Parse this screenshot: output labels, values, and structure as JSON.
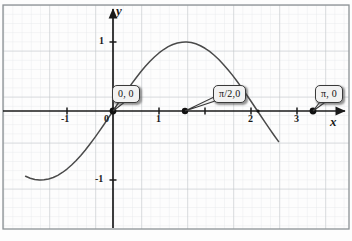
{
  "figure": {
    "kind": "cartesian-graph",
    "background_color": "#fdfdfd",
    "grid_minor_color": "#dfe3e6",
    "grid_major_color": "#b9bec2",
    "axis_color": "#1a1a1a",
    "curve_color": "#4a4a4a",
    "border_color": "#8d9296"
  },
  "axes": {
    "x_axis_label": "x",
    "y_axis_label": "y",
    "x_ticks": [
      {
        "value": -1,
        "label": "-1"
      },
      {
        "value": 0,
        "label": "0"
      },
      {
        "value": 1,
        "label": "1"
      },
      {
        "value": 2,
        "label": "2"
      },
      {
        "value": 3,
        "label": "3"
      }
    ],
    "y_ticks": [
      {
        "value": 1,
        "label": "1"
      },
      {
        "value": -1,
        "label": "-1"
      }
    ]
  },
  "callouts": [
    {
      "id": "origin",
      "label": "0, 0",
      "x": 0,
      "y": 0
    },
    {
      "id": "half-pi",
      "label": "π/2,0",
      "x": 1.5708,
      "y": 0
    },
    {
      "id": "pi",
      "label": "π, 0",
      "x": 3.1416,
      "y": 0
    }
  ],
  "chart_data": {
    "type": "line",
    "title": "",
    "xlabel": "x",
    "ylabel": "y",
    "xlim": [
      -1.9,
      3.6
    ],
    "ylim": [
      -1.62,
      1.55
    ],
    "grid": true,
    "legend": false,
    "series": [
      {
        "name": "sin(x)",
        "expression": "y = sin(x)",
        "x": [
          -1.9,
          -1.8,
          -1.7,
          -1.6,
          -1.5708,
          -1.5,
          -1.4,
          -1.3,
          -1.2,
          -1.1,
          -1.0,
          -0.9,
          -0.8,
          -0.7,
          -0.6,
          -0.5,
          -0.4,
          -0.3,
          -0.2,
          -0.1,
          0.0,
          0.1,
          0.2,
          0.3,
          0.4,
          0.5,
          0.6,
          0.7,
          0.8,
          0.9,
          1.0,
          1.1,
          1.2,
          1.3,
          1.4,
          1.5,
          1.5708,
          1.6,
          1.7,
          1.8,
          1.9,
          2.0,
          2.1,
          2.2,
          2.3,
          2.4,
          2.5,
          2.6,
          2.7,
          2.8,
          2.9,
          3.0,
          3.1416,
          3.2,
          3.3,
          3.4,
          3.5,
          3.6
        ],
        "y": [
          -0.946,
          -0.974,
          -0.992,
          -1.0,
          -1.0,
          -0.997,
          -0.985,
          -0.964,
          -0.932,
          -0.891,
          -0.841,
          -0.783,
          -0.717,
          -0.644,
          -0.565,
          -0.479,
          -0.389,
          -0.296,
          -0.199,
          -0.1,
          0.0,
          0.1,
          0.199,
          0.296,
          0.389,
          0.479,
          0.565,
          0.644,
          0.717,
          0.783,
          0.841,
          0.891,
          0.932,
          0.964,
          0.985,
          0.997,
          1.0,
          1.0,
          0.992,
          0.974,
          0.946,
          0.909,
          0.863,
          0.808,
          0.746,
          0.675,
          0.599,
          0.516,
          0.427,
          0.335,
          0.239,
          0.141,
          0.0,
          -0.058,
          -0.158,
          -0.256,
          -0.351,
          -0.443
        ]
      }
    ],
    "marked_points": [
      {
        "label": "0, 0",
        "x": 0,
        "y": 0
      },
      {
        "label": "π/2,0",
        "x": 1.5708,
        "y": 0
      },
      {
        "label": "π, 0",
        "x": 3.1416,
        "y": 0
      }
    ],
    "annotations": [
      "Zeros of sin(x) marked at x = 0 and x = π; maximum marked at x = π/2 label position"
    ]
  }
}
